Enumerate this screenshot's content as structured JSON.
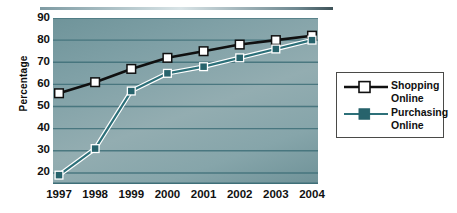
{
  "chart_data": {
    "type": "line",
    "title": "",
    "xlabel": "",
    "ylabel": "Percentage",
    "categories": [
      "1997",
      "1998",
      "1999",
      "2000",
      "2001",
      "2002",
      "2003",
      "2004"
    ],
    "ylim": [
      15,
      90
    ],
    "yticks": [
      90,
      80,
      70,
      60,
      50,
      40,
      30,
      20
    ],
    "grid": true,
    "legend_position": "right",
    "series": [
      {
        "name": "Shopping\nOnline",
        "label_line1": "Shopping",
        "label_line2": "Online",
        "color": "#101010",
        "marker": "open-square",
        "marker_fill": "#ffffff",
        "values": [
          56,
          61,
          67,
          72,
          75,
          78,
          80,
          82
        ]
      },
      {
        "name": "Purchasing\nOnline",
        "label_line1": "Purchasing",
        "label_line2": "Online",
        "color": "#2d7079",
        "marker": "filled-square",
        "marker_fill": "#27636c",
        "values": [
          19,
          31,
          57,
          65,
          68,
          72,
          76,
          80
        ]
      }
    ]
  },
  "axis": {
    "y_title": "Percentage",
    "y_tick_labels": [
      "90",
      "80",
      "70",
      "60",
      "50",
      "40",
      "30",
      "20"
    ],
    "x_tick_labels": [
      "1997",
      "1998",
      "1999",
      "2000",
      "2001",
      "2002",
      "2003",
      "2004"
    ]
  },
  "legend": {
    "items": [
      {
        "line1": "Shopping",
        "line2": "Online"
      },
      {
        "line1": "Purchasing",
        "line2": "Online"
      }
    ]
  },
  "colors": {
    "plot_background": "#86a5aa",
    "gridline": "#3e6f78",
    "shopping_line": "#101010",
    "purchasing_line": "#2d7079",
    "purchasing_marker": "#27636c",
    "marker_outline": "#ffffff",
    "legend_border": "#4a4a48",
    "text": "#111111"
  }
}
